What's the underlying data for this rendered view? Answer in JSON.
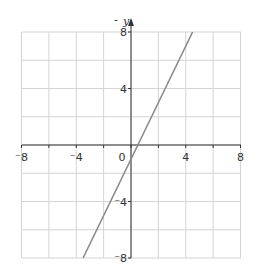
{
  "chart_data": {
    "type": "line",
    "title": "",
    "xlabel": "",
    "ylabel": "y",
    "xlim": [
      -8,
      8
    ],
    "ylim": [
      -8,
      8
    ],
    "grid": true,
    "grid_step": 2,
    "x_ticks": [
      -8,
      -4,
      0,
      4,
      8
    ],
    "y_ticks": [
      -8,
      -4,
      4,
      8
    ],
    "x_tick_labels": [
      "⁻8",
      "⁻4",
      "0",
      "4",
      "8"
    ],
    "y_tick_labels": [
      "⁻8",
      "⁻4",
      "4",
      "8"
    ],
    "series": [
      {
        "name": "y = 2x - 1",
        "equation": "y = 2x - 1",
        "slope": 2,
        "intercept": -1,
        "x": [
          -3.5,
          4.5
        ],
        "y": [
          -8,
          8
        ]
      }
    ]
  },
  "colors": {
    "grid": "#d4d4d4",
    "axis": "#333333",
    "line": "#8a8a8a"
  }
}
